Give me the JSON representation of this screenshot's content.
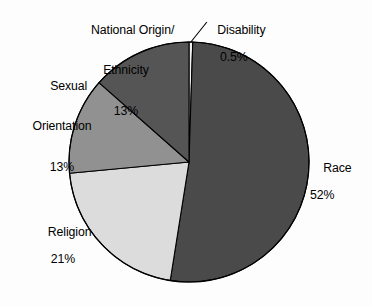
{
  "chart_data": {
    "type": "pie",
    "title": "",
    "subtitle": "",
    "xlabel": "",
    "ylabel": "",
    "legend_position": "none",
    "grid": false,
    "value_unit": "percent",
    "total": 99.5,
    "categories": [
      "Disability",
      "Race",
      "Religion",
      "Sexual Orientation",
      "National Origin/Ethnicity"
    ],
    "values": [
      0.5,
      52,
      21,
      13,
      13
    ],
    "slices": [
      {
        "id": "disability",
        "label": "Disability",
        "label_line1": "Disability",
        "label_line2": "",
        "value": 0.5,
        "value_text": "0.5%",
        "color": "#f2f2f2",
        "start_angle_deg": 0,
        "end_angle_deg": 1.8,
        "leader_line": true
      },
      {
        "id": "race",
        "label": "Race",
        "label_line1": "Race",
        "label_line2": "",
        "value": 52,
        "value_text": "52%",
        "color": "#4a4a4a",
        "start_angle_deg": 1.8,
        "end_angle_deg": 189.0,
        "leader_line": false
      },
      {
        "id": "religion",
        "label": "Religion",
        "label_line1": "Religion",
        "label_line2": "",
        "value": 21,
        "value_text": "21%",
        "color": "#dcdcdc",
        "start_angle_deg": 189.0,
        "end_angle_deg": 264.6,
        "leader_line": false
      },
      {
        "id": "sexual-orientation",
        "label": "Sexual Orientation",
        "label_line1": "Sexual",
        "label_line2": "Orientation",
        "value": 13,
        "value_text": "13%",
        "color": "#919191",
        "start_angle_deg": 264.6,
        "end_angle_deg": 311.4,
        "leader_line": false
      },
      {
        "id": "national-origin",
        "label": "National Origin/Ethnicity",
        "label_line1": "National Origin/",
        "label_line2": "Ethnicity",
        "value": 13,
        "value_text": "13%",
        "color": "#555555",
        "start_angle_deg": 311.4,
        "end_angle_deg": 360.0,
        "leader_line": false
      }
    ],
    "geometry": {
      "center_x": 189,
      "center_y": 162,
      "radius": 120,
      "outline_color": "#000000",
      "background": "#fdfdfd"
    }
  }
}
